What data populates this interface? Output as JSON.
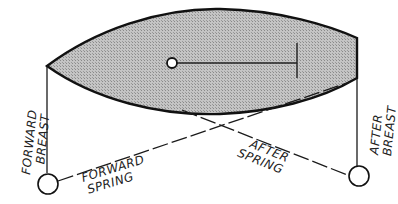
{
  "diagram": {
    "title": "",
    "colors": {
      "hull_fill": "#b8b8b8",
      "hull_outline": "#111111",
      "line": "#1a1a1a",
      "background": "#ffffff"
    },
    "lines": {
      "forward_breast": {
        "label_line1": "FORWARD",
        "label_line2": "BREAST"
      },
      "after_breast": {
        "label_line1": "AFTER",
        "label_line2": "BREAST"
      },
      "forward_spring": {
        "label_line1": "FORWARD",
        "label_line2": "SPRING"
      },
      "after_spring": {
        "label_line1": "AFTER",
        "label_line2": "SPRING"
      }
    },
    "elements": [
      "hull",
      "tiller",
      "forward-bollard",
      "after-bollard"
    ]
  }
}
